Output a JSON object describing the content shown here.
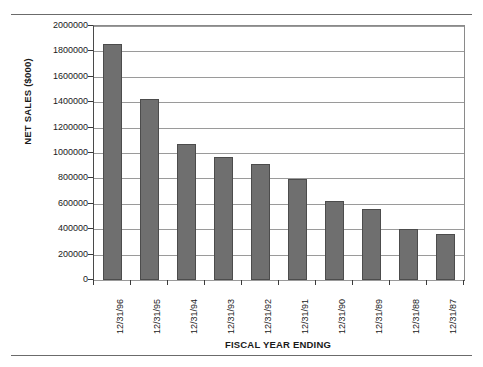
{
  "chart_data": {
    "type": "bar",
    "title": "",
    "xlabel": "FISCAL YEAR ENDING",
    "ylabel": "NET SALES ($000)",
    "categories": [
      "12/31/96",
      "12/31/95",
      "12/31/94",
      "12/31/93",
      "12/31/92",
      "12/31/91",
      "12/31/90",
      "12/31/89",
      "12/31/88",
      "12/31/87"
    ],
    "values": [
      1855000,
      1425000,
      1070000,
      968000,
      910000,
      798000,
      625000,
      557000,
      400000,
      360000
    ],
    "ylim": [
      0,
      2000000
    ],
    "ytick_labels": [
      "2000000",
      "1800000",
      "1600000",
      "1400000",
      "1200000",
      "1000000",
      "800000",
      "600000",
      "400000",
      "200000",
      "0"
    ],
    "ytick_values": [
      2000000,
      1800000,
      1600000,
      1400000,
      1200000,
      1000000,
      800000,
      600000,
      400000,
      200000,
      0
    ],
    "grid": true,
    "legend": "none",
    "bar_color": "#6f6f6f",
    "bar_edge_color": "#4c4c4c",
    "gridline_color": "#9a9a9a",
    "axis_color": "#3a3a3a",
    "background_color": "#ffffff"
  }
}
